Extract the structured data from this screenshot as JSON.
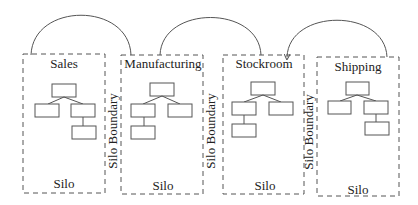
{
  "diagram": {
    "silos": [
      {
        "title": "Sales",
        "footer": "Silo"
      },
      {
        "title": "Manufacturing",
        "footer": "Silo"
      },
      {
        "title": "Stockroom",
        "footer": "Silo"
      },
      {
        "title": "Shipping",
        "footer": "Silo"
      }
    ],
    "boundaries": [
      {
        "label": "Silo Boundary"
      },
      {
        "label": "Silo Boundary"
      },
      {
        "label": "Silo Boundary"
      }
    ],
    "connectors": [
      {
        "from": "Sales",
        "to": "Manufacturing"
      },
      {
        "from": "Manufacturing",
        "to": "Stockroom"
      },
      {
        "from": "Stockroom",
        "to": "Shipping"
      }
    ],
    "colors": {
      "stroke": "#555555",
      "text": "#222222",
      "background": "#ffffff"
    }
  }
}
